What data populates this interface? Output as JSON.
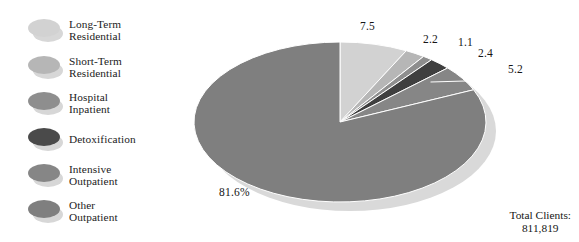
{
  "legend": {
    "items": [
      {
        "label": "Long-Term\nResidential",
        "color": "#d2d2d2",
        "name": "legend-item-long-term-residential"
      },
      {
        "label": "Short-Term\nResidential",
        "color": "#b6b6b6",
        "name": "legend-item-short-term-residential"
      },
      {
        "label": "Hospital\nInpatient",
        "color": "#8e8e8e",
        "name": "legend-item-hospital-inpatient"
      },
      {
        "label": "Detoxification",
        "color": "#4a4a4a",
        "name": "legend-item-detoxification"
      },
      {
        "label": "Intensive\nOutpatient",
        "color": "#868686",
        "name": "legend-item-intensive-outpatient"
      },
      {
        "label": "Other\nOutpatient",
        "color": "#7f7f7f",
        "name": "legend-item-other-outpatient"
      }
    ]
  },
  "footer": {
    "total_label": "Total Clients:\n811,819"
  },
  "chart_data": {
    "type": "pie",
    "title": "",
    "unit": "percent",
    "total_clients": 811819,
    "total_clients_text": "811,819",
    "legend_position": "left",
    "start_angle_deg": 0,
    "direction": "clockwise",
    "categories": [
      "Long-Term Residential",
      "Short-Term Residential",
      "Hospital Inpatient",
      "Detoxification",
      "Intensive Outpatient",
      "Other Outpatient"
    ],
    "values": [
      7.5,
      2.2,
      1.1,
      2.4,
      5.2,
      81.6
    ],
    "labels": [
      "7.5",
      "2.2",
      "1.1",
      "2.4",
      "5.2",
      "81.6%"
    ],
    "colors": [
      "#d2d2d2",
      "#b6b6b6",
      "#8e8e8e",
      "#3f3f3f",
      "#868686",
      "#7f7f7f"
    ],
    "shadow_color": "#d9d9d9",
    "slice_divider_color": "#ffffff"
  }
}
